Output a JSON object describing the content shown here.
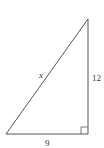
{
  "diagram": {
    "type": "right-triangle",
    "labels": {
      "hypotenuse": "x",
      "vertical_leg": "12",
      "horizontal_leg": "9"
    },
    "colors": {
      "stroke": "#555555",
      "text": "#333333",
      "background": "#ffffff"
    },
    "right_angle_marker": true
  }
}
